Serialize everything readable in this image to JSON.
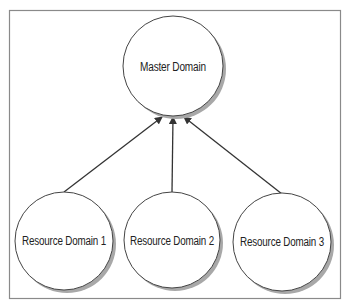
{
  "diagram": {
    "type": "hierarchy",
    "frame": {
      "x": 9,
      "y": 10,
      "width": 331,
      "height": 288,
      "color": "#8a8a8a"
    },
    "nodes": [
      {
        "id": "master",
        "label": "Master Domain",
        "cx": 173,
        "cy": 66,
        "r": 50
      },
      {
        "id": "res1",
        "label": "Resource Domain 1",
        "cx": 64,
        "cy": 241,
        "r": 49
      },
      {
        "id": "res2",
        "label": "Resource Domain 2",
        "cx": 172,
        "cy": 240,
        "r": 48
      },
      {
        "id": "res3",
        "label": "Resource Domain 3",
        "cx": 282,
        "cy": 242,
        "r": 49
      }
    ],
    "edges": [
      {
        "from": "res1",
        "to": "master",
        "x1": 64,
        "y1": 192,
        "x2": 162,
        "y2": 117,
        "arrow": "end"
      },
      {
        "from": "res2",
        "to": "master",
        "x1": 172,
        "y1": 192,
        "x2": 173,
        "y2": 117,
        "arrow": "end"
      },
      {
        "from": "res3",
        "to": "master",
        "x1": 282,
        "y1": 194,
        "x2": 184,
        "y2": 117,
        "arrow": "end"
      }
    ],
    "colors": {
      "stroke": "#444444",
      "shadow": "#9a9a9a",
      "fill": "#ffffff",
      "line": "#333333"
    }
  }
}
